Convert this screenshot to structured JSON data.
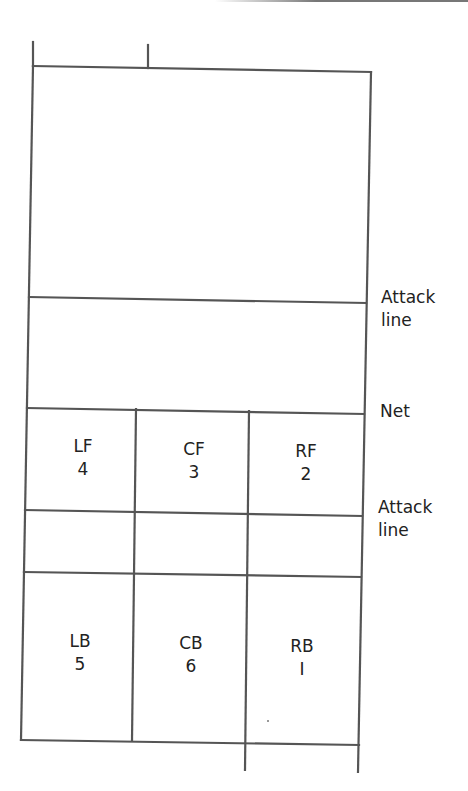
{
  "diagram": {
    "side_labels": {
      "attack_line_upper": [
        "Attack",
        "line"
      ],
      "net": "Net",
      "attack_line_lower": [
        "Attack",
        "line"
      ]
    },
    "front_row": [
      {
        "code": "LF",
        "number": "4"
      },
      {
        "code": "CF",
        "number": "3"
      },
      {
        "code": "RF",
        "number": "2"
      }
    ],
    "back_row": [
      {
        "code": "LB",
        "number": "5"
      },
      {
        "code": "CB",
        "number": "6"
      },
      {
        "code": "RB",
        "number": "I"
      }
    ],
    "colors": {
      "line": "#555555",
      "text": "#222222",
      "background": "#ffffff"
    }
  }
}
